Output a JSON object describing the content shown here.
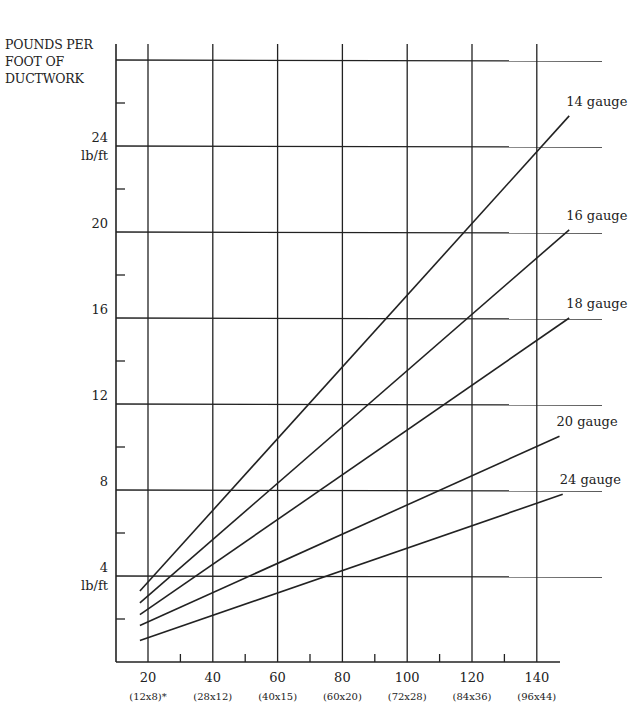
{
  "chart_data": {
    "type": "line",
    "title": "",
    "ylabel": "POUNDS PER FOOT OF DUCTWORK",
    "ylabel_lines": [
      "POUNDS PER",
      "FOOT OF",
      "DUCTWORK"
    ],
    "xlabel": "",
    "xlim": [
      10,
      150
    ],
    "ylim": [
      0,
      28
    ],
    "grid": true,
    "y_ticks": [
      {
        "value": 4,
        "label": "4",
        "unit": "lb/ft"
      },
      {
        "value": 8,
        "label": "8"
      },
      {
        "value": 12,
        "label": "12"
      },
      {
        "value": 16,
        "label": "16"
      },
      {
        "value": 20,
        "label": "20"
      },
      {
        "value": 24,
        "label": "24",
        "unit": "lb/ft"
      }
    ],
    "x_ticks": [
      {
        "value": 20,
        "label": "20",
        "sub": "(12x8)*"
      },
      {
        "value": 40,
        "label": "40",
        "sub": "(28x12)"
      },
      {
        "value": 60,
        "label": "60",
        "sub": "(40x15)"
      },
      {
        "value": 80,
        "label": "80",
        "sub": "(60x20)"
      },
      {
        "value": 100,
        "label": "100",
        "sub": "(72x28)"
      },
      {
        "value": 120,
        "label": "120",
        "sub": "(84x36)"
      },
      {
        "value": 140,
        "label": "140",
        "sub": "(96x44)"
      }
    ],
    "legend_position": "inline-right",
    "series": [
      {
        "name": "14 gauge",
        "x": [
          17.5,
          150
        ],
        "values": [
          3.3,
          25.4
        ]
      },
      {
        "name": "16 gauge",
        "x": [
          17.5,
          150
        ],
        "values": [
          2.75,
          20.1
        ]
      },
      {
        "name": "18 gauge",
        "x": [
          17.5,
          150
        ],
        "values": [
          2.2,
          16.0
        ]
      },
      {
        "name": "20 gauge",
        "x": [
          17.5,
          147
        ],
        "values": [
          1.7,
          10.5
        ]
      },
      {
        "name": "24 gauge",
        "x": [
          17.5,
          148
        ],
        "values": [
          1.0,
          7.8
        ]
      }
    ]
  }
}
